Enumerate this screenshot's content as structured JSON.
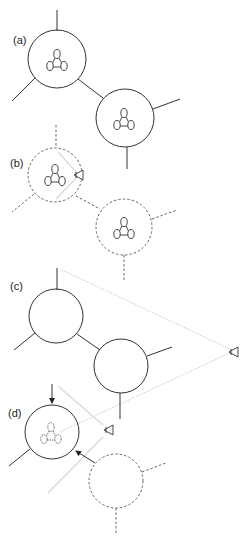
{
  "figure": {
    "panels": [
      {
        "id": "a",
        "label": "(a)",
        "description": "two joined nodes each containing a triangular molecule"
      },
      {
        "id": "b",
        "label": "(b)",
        "description": "dashed nodes with viewer eye inside first node"
      },
      {
        "id": "c",
        "label": "(c)",
        "description": "empty nodes viewed from distant eye with dotted view cone"
      },
      {
        "id": "d",
        "label": "(d)",
        "description": "node with dashed molecule, incoming arrows, dashed neighbor node"
      }
    ],
    "icons": {
      "eye": "eye-icon",
      "arrow": "arrow-icon",
      "molecule": "triangle-molecule-icon"
    },
    "colors": {
      "stroke": "#333333",
      "dashed": "#666666",
      "faint": "#c8c8c8",
      "background": "#ffffff"
    }
  }
}
